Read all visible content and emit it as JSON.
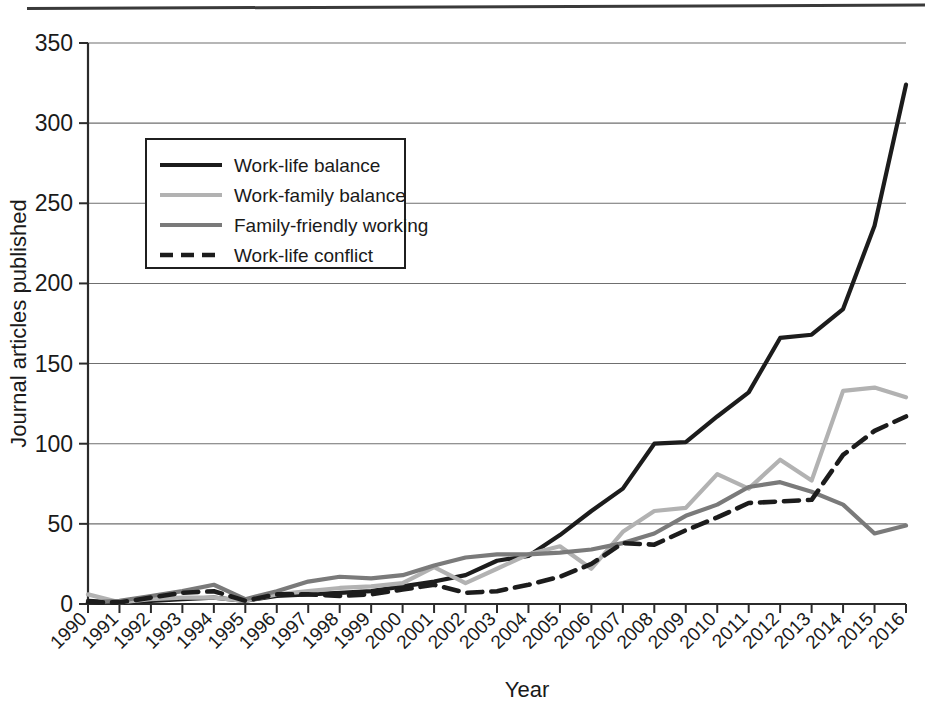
{
  "chart_data": {
    "type": "line",
    "title": "",
    "xlabel": "Year",
    "ylabel": "Journal articles published",
    "grid": true,
    "legend_position": "upper-left-inside",
    "xlim": [
      1990,
      2016
    ],
    "ylim": [
      0,
      350
    ],
    "ytick_labels": [
      "0",
      "50",
      "100",
      "150",
      "200",
      "250",
      "300",
      "350"
    ],
    "ytick_values": [
      0,
      50,
      100,
      150,
      200,
      250,
      300,
      350
    ],
    "categories": [
      "1990",
      "1991",
      "1992",
      "1993",
      "1994",
      "1995",
      "1996",
      "1997",
      "1998",
      "1999",
      "2000",
      "2001",
      "2002",
      "2003",
      "2004",
      "2005",
      "2006",
      "2007",
      "2008",
      "2009",
      "2010",
      "2011",
      "2012",
      "2013",
      "2014",
      "2015",
      "2016"
    ],
    "series": [
      {
        "name": "Work-life balance",
        "color": "#1c1c1c",
        "style": "solid",
        "width": 4.2,
        "values": [
          2,
          1,
          2,
          3,
          4,
          2,
          5,
          6,
          7,
          8,
          11,
          14,
          18,
          27,
          30,
          43,
          58,
          72,
          100,
          101,
          117,
          132,
          166,
          168,
          184,
          236,
          300
        ]
      },
      {
        "name": "Work-family balance",
        "color": "#b2b2b2",
        "style": "solid",
        "width": 4.2,
        "values": [
          6,
          1,
          3,
          4,
          4,
          2,
          6,
          8,
          10,
          11,
          13,
          23,
          13,
          22,
          31,
          36,
          22,
          45,
          58,
          60,
          81,
          72,
          90,
          77,
          133,
          135,
          129
        ]
      },
      {
        "name": "Family-friendly working",
        "color": "#7a7a7a",
        "style": "solid",
        "width": 4.2,
        "values": [
          1,
          2,
          5,
          8,
          12,
          3,
          8,
          14,
          17,
          16,
          18,
          24,
          29,
          31,
          31,
          32,
          34,
          38,
          44,
          55,
          62,
          73,
          76,
          70,
          62,
          44,
          49
        ]
      },
      {
        "name": "Work-life conflict",
        "color": "#1c1c1c",
        "style": "dashed",
        "width": 4.6,
        "values": [
          1,
          1,
          4,
          7,
          8,
          2,
          6,
          6,
          5,
          6,
          9,
          12,
          7,
          8,
          12,
          17,
          25,
          38,
          37,
          46,
          54,
          63,
          64,
          65,
          93,
          108,
          117
        ]
      }
    ],
    "series_overrides": {
      "Work-life balance_2016": 324
    }
  },
  "legend": {
    "items": [
      {
        "label": "Work-life balance"
      },
      {
        "label": "Work-family balance"
      },
      {
        "label": "Family-friendly working"
      },
      {
        "label": "Work-life conflict"
      }
    ]
  },
  "axes": {
    "x_title": "Year",
    "y_title": "Journal articles published"
  }
}
